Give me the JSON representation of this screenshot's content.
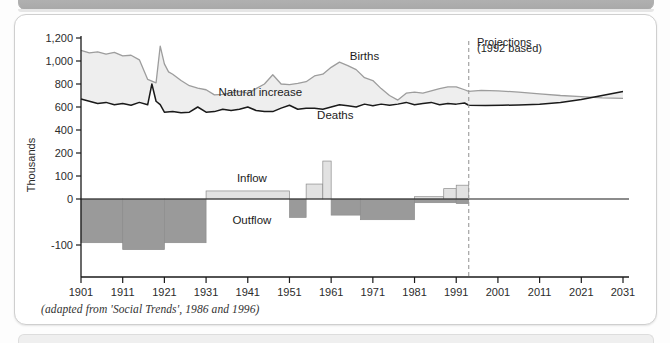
{
  "figure": {
    "caption": "(adapted from 'Social Trends', 1986 and 1996)"
  },
  "chart_data": {
    "type": "area",
    "title": "",
    "xlabel": "",
    "ylabel": "Thousands",
    "grid": false,
    "legend_position": "inline-annotations",
    "xlim": [
      1901,
      2031
    ],
    "xticks": [
      "1901",
      "1911",
      "1921",
      "1931",
      "1941",
      "1951",
      "1961",
      "1971",
      "1981",
      "1991",
      "2001",
      "2011",
      "2021",
      "2031"
    ],
    "yticks": [
      "1,200",
      "1,000",
      "800",
      "600",
      "400",
      "200",
      "100",
      "0",
      "-100"
    ],
    "ytick_values": [
      1200,
      1000,
      800,
      600,
      400,
      200,
      100,
      0,
      -100
    ],
    "y_axis_note": "broken/compressed scale below 200",
    "annotations": [
      {
        "name": "births-label",
        "text": "Births",
        "x": 1969,
        "y": 1010
      },
      {
        "name": "natural-increase-label",
        "text": "Natural increase",
        "x": 1944,
        "y": 700
      },
      {
        "name": "deaths-label",
        "text": "Deaths",
        "x": 1962,
        "y": 500
      },
      {
        "name": "inflow-label",
        "text": "Inflow",
        "x": 1942,
        "y": 75
      },
      {
        "name": "outflow-label",
        "text": "Outflow",
        "x": 1942,
        "y": -55
      },
      {
        "name": "projections-label",
        "text": "Projections",
        "x": 1996,
        "y": 1130
      },
      {
        "name": "projections-basis-label",
        "text": "(1992 based)",
        "x": 1996,
        "y": 1075
      }
    ],
    "projection_divider": {
      "year": 1994,
      "style": "dashed",
      "color": "#9a9a9a"
    },
    "colors": {
      "births_line": "#9d9d9d",
      "natural_increase_fill": "#eeeeee",
      "deaths_line": "#1a1a1a",
      "inflow_fill": "#e2e2e2",
      "outflow_fill": "#9a9a9a",
      "axis": "#1a1a1a"
    },
    "series": [
      {
        "name": "Births",
        "unit": "thousands",
        "x": [
          1901,
          1903,
          1905,
          1907,
          1909,
          1911,
          1913,
          1915,
          1917,
          1919,
          1920,
          1921,
          1922,
          1923,
          1925,
          1927,
          1929,
          1931,
          1933,
          1935,
          1937,
          1939,
          1941,
          1943,
          1945,
          1947,
          1949,
          1951,
          1953,
          1955,
          1957,
          1959,
          1961,
          1963,
          1965,
          1967,
          1969,
          1971,
          1973,
          1975,
          1977,
          1979,
          1981,
          1983,
          1985,
          1987,
          1989,
          1991,
          1993,
          1994
        ],
        "values": [
          1093,
          1070,
          1080,
          1060,
          1075,
          1045,
          1050,
          1010,
          840,
          810,
          1130,
          975,
          905,
          885,
          830,
          785,
          765,
          750,
          705,
          710,
          725,
          735,
          720,
          760,
          800,
          880,
          800,
          795,
          805,
          820,
          870,
          885,
          945,
          990,
          960,
          925,
          855,
          830,
          760,
          700,
          660,
          720,
          730,
          720,
          740,
          760,
          775,
          775,
          750,
          735
        ]
      },
      {
        "name": "Births projection",
        "unit": "thousands",
        "projection": true,
        "x": [
          1994,
          1997,
          2001,
          2006,
          2011,
          2016,
          2021,
          2026,
          2031
        ],
        "values": [
          735,
          745,
          740,
          730,
          715,
          700,
          690,
          680,
          675
        ]
      },
      {
        "name": "Deaths",
        "unit": "thousands",
        "x": [
          1901,
          1903,
          1905,
          1907,
          1909,
          1911,
          1913,
          1915,
          1917,
          1918,
          1919,
          1920,
          1921,
          1923,
          1925,
          1927,
          1929,
          1931,
          1933,
          1935,
          1937,
          1939,
          1941,
          1943,
          1945,
          1947,
          1949,
          1951,
          1953,
          1955,
          1957,
          1959,
          1961,
          1963,
          1965,
          1967,
          1969,
          1971,
          1973,
          1975,
          1977,
          1979,
          1981,
          1983,
          1985,
          1987,
          1989,
          1991,
          1993,
          1994
        ],
        "values": [
          670,
          650,
          630,
          640,
          620,
          630,
          615,
          640,
          620,
          800,
          650,
          620,
          555,
          560,
          550,
          555,
          600,
          555,
          560,
          580,
          570,
          580,
          600,
          570,
          560,
          560,
          590,
          615,
          580,
          590,
          590,
          580,
          600,
          620,
          610,
          600,
          625,
          610,
          625,
          615,
          625,
          640,
          620,
          630,
          640,
          620,
          630,
          625,
          635,
          615
        ]
      },
      {
        "name": "Deaths projection",
        "unit": "thousands",
        "projection": true,
        "x": [
          1994,
          1998,
          2002,
          2006,
          2011,
          2016,
          2021,
          2026,
          2031
        ],
        "values": [
          615,
          612,
          615,
          618,
          625,
          640,
          665,
          700,
          735
        ]
      },
      {
        "name": "Inflow",
        "unit": "thousands per decade (annual average)",
        "type": "step",
        "periods": [
          {
            "from": 1931,
            "to": 1951,
            "value": 35
          },
          {
            "from": 1955,
            "to": 1959,
            "value": 65
          },
          {
            "from": 1959,
            "to": 1961,
            "value": 165
          },
          {
            "from": 1981,
            "to": 1988,
            "value": 10
          },
          {
            "from": 1988,
            "to": 1991,
            "value": 45
          },
          {
            "from": 1991,
            "to": 1994,
            "value": 60
          }
        ]
      },
      {
        "name": "Outflow",
        "unit": "thousands per decade (annual average)",
        "type": "step",
        "periods": [
          {
            "from": 1901,
            "to": 1911,
            "value": -95
          },
          {
            "from": 1911,
            "to": 1921,
            "value": -110
          },
          {
            "from": 1921,
            "to": 1931,
            "value": -95
          },
          {
            "from": 1951,
            "to": 1955,
            "value": -40
          },
          {
            "from": 1961,
            "to": 1968,
            "value": -35
          },
          {
            "from": 1968,
            "to": 1981,
            "value": -45
          },
          {
            "from": 1981,
            "to": 1991,
            "value": -8
          },
          {
            "from": 1991,
            "to": 1994,
            "value": -10
          }
        ]
      }
    ]
  }
}
